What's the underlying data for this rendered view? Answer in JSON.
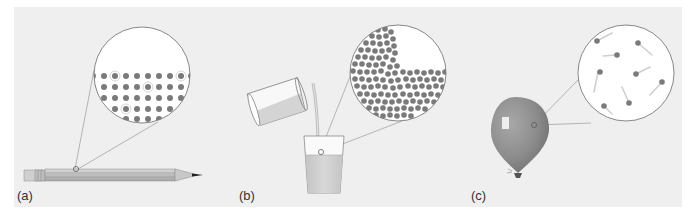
{
  "figure": {
    "panels": [
      {
        "id": "a",
        "label": "(a)",
        "object": "pencil",
        "state": "solid",
        "inset": "molecules arranged in a regular lattice"
      },
      {
        "id": "b",
        "label": "(b)",
        "object": "liquid being poured from a tilted glass into another glass",
        "state": "liquid",
        "inset": "closely packed molecules with irregular arrangement"
      },
      {
        "id": "c",
        "label": "(c)",
        "object": "balloon",
        "state": "gas",
        "inset": "widely spaced molecules moving with motion trails"
      }
    ],
    "colors": {
      "background": "#efefef",
      "molecule": "#7a7a7a",
      "inset_fill": "#ffffff",
      "outline": "#6a6a6a",
      "balloon": "#8f8f8f",
      "liquid": "#cfcfcf"
    }
  }
}
